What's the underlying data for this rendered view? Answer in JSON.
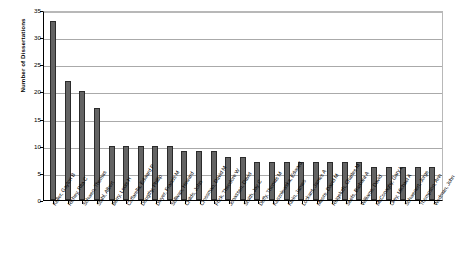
{
  "chart_data": {
    "type": "bar",
    "title": "",
    "xlabel": "",
    "ylabel": "Number of Dissertations",
    "ylim": [
      0,
      35
    ],
    "yticks": [
      0,
      5,
      10,
      15,
      20,
      25,
      30,
      35
    ],
    "grid": true,
    "legend": false,
    "bar_color": "#636363",
    "bar_border_color": "#2b2b2b",
    "categories": [
      "Keller, Gayton B",
      "Richey, Rita C",
      "Schwen, Thomas",
      "Stahl, Albert",
      "Berry, Louis H",
      "Caffarella, Edward P",
      "Dougthy, Phillip",
      "Dwyer, Francis M",
      "Sullivan, Howard",
      "Childs, John",
      "Crossman, David M",
      "Frick, Theodore W",
      "Jonassen, David",
      "Smith, Jay C",
      "Duffy, Thomas M",
      "Kaszniewska, Edward",
      "Klein, James",
      "Lockard, James A",
      "Moore, David M",
      "Reigeluth, Charles M",
      "Seels, Barbara A",
      "Williams, David",
      "McConaghy, Gary L",
      "Orey, Michael A",
      "Schwenert, Jorge",
      "Thompson, Ann",
      "Wedman, John"
    ],
    "values": [
      33,
      22,
      20,
      17,
      10,
      10,
      10,
      10,
      10,
      9,
      9,
      9,
      8,
      8,
      7,
      7,
      7,
      7,
      7,
      7,
      7,
      7,
      6,
      6,
      6,
      6,
      6
    ],
    "tick_labels": [
      "0",
      "5",
      "10",
      "15",
      "20",
      "25",
      "30",
      "35"
    ]
  }
}
